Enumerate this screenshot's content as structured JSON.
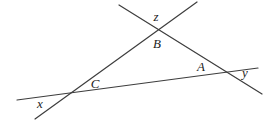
{
  "figure": {
    "background": "#ffffff",
    "stroke_color": "#3d3d3d",
    "stroke_width": 1.2,
    "width": 268,
    "height": 125,
    "lines": [
      {
        "name": "line-through-C-and-A",
        "x1": 17,
        "y1": 100,
        "x2": 258,
        "y2": 68
      },
      {
        "name": "line-through-C-and-B",
        "x1": 35,
        "y1": 119,
        "x2": 197,
        "y2": 2
      },
      {
        "name": "line-through-B-and-A",
        "x1": 119,
        "y1": 5,
        "x2": 262,
        "y2": 94
      }
    ],
    "vertices": [
      {
        "name": "vertex-B",
        "x": 158,
        "y": 30
      },
      {
        "name": "vertex-C",
        "x": 71,
        "y": 93
      },
      {
        "name": "vertex-A",
        "x": 226,
        "y": 72
      }
    ],
    "labels": [
      {
        "name": "label-interior-angle-A",
        "text": "A",
        "x": 201,
        "y": 66
      },
      {
        "name": "label-interior-angle-B",
        "text": "B",
        "x": 157,
        "y": 43
      },
      {
        "name": "label-interior-angle-C",
        "text": "C",
        "x": 95,
        "y": 83
      },
      {
        "name": "label-exterior-angle-x",
        "text": "x",
        "x": 40,
        "y": 103
      },
      {
        "name": "label-exterior-angle-y",
        "text": "y",
        "x": 245,
        "y": 72
      },
      {
        "name": "label-exterior-angle-z",
        "text": "z",
        "x": 156,
        "y": 16
      }
    ]
  }
}
